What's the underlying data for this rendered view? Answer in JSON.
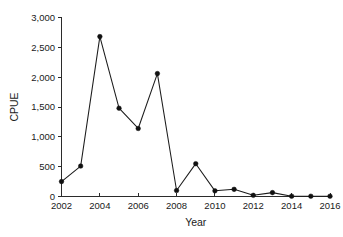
{
  "chart_data": {
    "type": "line",
    "title": "",
    "xlabel": "Year",
    "ylabel": "CPUE",
    "x": [
      2002,
      2003,
      2004,
      2005,
      2006,
      2007,
      2008,
      2009,
      2010,
      2011,
      2012,
      2013,
      2014,
      2015,
      2016
    ],
    "values": [
      250,
      510,
      2680,
      1480,
      1140,
      2060,
      100,
      550,
      95,
      120,
      20,
      65,
      5,
      5,
      5
    ],
    "series": [
      {
        "name": "CPUE",
        "values": [
          250,
          510,
          2680,
          1480,
          1140,
          2060,
          100,
          550,
          95,
          120,
          20,
          65,
          5,
          5,
          5
        ]
      }
    ],
    "xlim": [
      2002,
      2016
    ],
    "ylim": [
      0,
      3000
    ],
    "xticks": [
      2002,
      2004,
      2006,
      2008,
      2010,
      2012,
      2014,
      2016
    ],
    "xtick_labels": [
      "2002",
      "2004",
      "2006",
      "2008",
      "2010",
      "2012",
      "2014",
      "2016"
    ],
    "yticks": [
      0,
      500,
      1000,
      1500,
      2000,
      2500,
      3000
    ],
    "ytick_labels": [
      "0",
      "500",
      "1,000",
      "1,500",
      "2,000",
      "2,500",
      "3,000"
    ],
    "grid": false,
    "legend": false,
    "marker": "circle",
    "line_color": "#1c1c1c",
    "marker_color": "#111111",
    "background_color": "#ffffff"
  }
}
